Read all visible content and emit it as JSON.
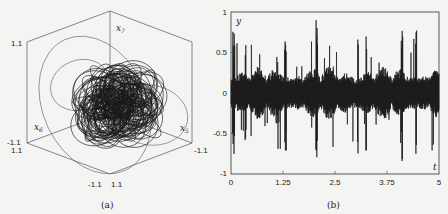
{
  "chart_data": [
    {
      "type": "line",
      "panel": "(a)",
      "title": "",
      "description": "3D phase portrait (chaotic attractor) projected on x5-x6-x7 axes",
      "axes": {
        "x5": {
          "label": "x5",
          "range": [
            -1.1,
            1.1
          ]
        },
        "x6": {
          "label": "x6",
          "range": [
            -1.1,
            1.1
          ]
        },
        "x7": {
          "label": "x7",
          "range": [
            -1.1,
            1.1
          ]
        }
      },
      "tick_labels": {
        "left_top": "1.1",
        "left_bottom_a": "-1.1",
        "left_bottom_b": "1.1",
        "bottom_a": "-1.1",
        "bottom_b": "1.1",
        "right_bottom": "-1.1"
      },
      "caption": "(a)"
    },
    {
      "type": "line",
      "panel": "(b)",
      "title": "",
      "xlabel": "t",
      "ylabel": "y",
      "xlim": [
        0,
        5
      ],
      "ylim": [
        -1,
        1
      ],
      "x_ticks": [
        "0",
        "1.25",
        "2.5",
        "3.75",
        "5"
      ],
      "y_ticks": [
        "1",
        "0.5",
        "0",
        "-0.5",
        "-1"
      ],
      "grid": false,
      "description": "Chaotic oscillating time series y(t), amplitude mostly within ±0.3 with spikes up to about ±0.9",
      "approx_envelope_peaks": [
        {
          "t": 0.05,
          "y": 0.82
        },
        {
          "t": 0.08,
          "y": -0.87
        },
        {
          "t": 0.35,
          "y": 0.62
        },
        {
          "t": 0.35,
          "y": -0.75
        },
        {
          "t": 1.3,
          "y": 0.83
        },
        {
          "t": 1.32,
          "y": -0.72
        },
        {
          "t": 2.05,
          "y": 0.9
        },
        {
          "t": 2.07,
          "y": -0.92
        },
        {
          "t": 3.05,
          "y": 0.78
        },
        {
          "t": 3.25,
          "y": -0.75
        },
        {
          "t": 4.1,
          "y": 0.73
        },
        {
          "t": 4.12,
          "y": -0.86
        },
        {
          "t": 4.45,
          "y": -0.78
        }
      ],
      "caption": "(b)"
    }
  ],
  "panel_a": {
    "axis_labels": {
      "x5": "x",
      "x5_sub": "5",
      "x6": "x",
      "x6_sub": "6",
      "x7": "x",
      "x7_sub": "7"
    },
    "ticks": {
      "lt": "1.1",
      "lb1": "-1.1",
      "lb2": "1.1",
      "b1": "-1.1",
      "b2": "1.1",
      "rb": "-1.1"
    },
    "caption": "(a)"
  },
  "panel_b": {
    "ylabel": "y",
    "xlabel": "t",
    "y_ticks": [
      "1",
      "0.5",
      "0",
      "-0.5",
      "-1"
    ],
    "x_ticks": [
      "0",
      "1.25",
      "2.5",
      "3.75",
      "5"
    ],
    "caption": "(b)"
  }
}
